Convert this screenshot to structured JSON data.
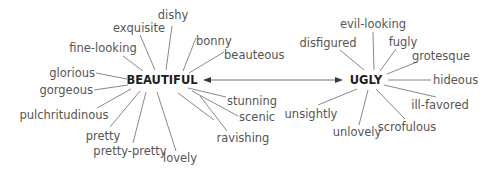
{
  "diagram": {
    "title": "",
    "hubs": {
      "beautiful": {
        "label": "BEAUTIFUL",
        "synonyms": [
          "dishy",
          "exquisite",
          "bonny",
          "fine-looking",
          "beauteous",
          "glorious",
          "gorgeous",
          "stunning",
          "pulchritudinous",
          "scenic",
          "pretty",
          "ravishing",
          "pretty-pretty",
          "lovely"
        ]
      },
      "ugly": {
        "label": "UGLY",
        "synonyms": [
          "evil-looking",
          "disfigured",
          "fugly",
          "grotesque",
          "hideous",
          "ill-favored",
          "unsightly",
          "unlovely",
          "scrofulous"
        ]
      }
    },
    "relation": {
      "type": "antonym",
      "style": "double-headed-arrow"
    },
    "colors": {
      "hub_text": "#1e1e1e",
      "word_text": "#555555",
      "spoke": "#6a6a6a",
      "arrow": "#3a3a3a",
      "background": "#ffffff"
    }
  }
}
